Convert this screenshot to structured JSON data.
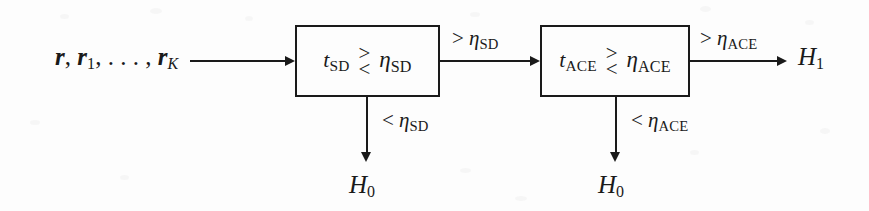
{
  "diagram": {
    "background_color": "#fdfdfd",
    "line_color": "#1a1a1a",
    "input": {
      "label_r": "r",
      "comma1": ", ",
      "label_r1": "r",
      "sub_1": "1",
      "ellipsis": ", . . . , ",
      "label_rK": "r",
      "sub_K": "K"
    },
    "stage1": {
      "statistic": "t",
      "statistic_sub": "SD",
      "cmp_top": ">",
      "cmp_bottom": "<",
      "threshold": "η",
      "threshold_sub": "SD",
      "accept_label_op": ">",
      "accept_label_sym": "η",
      "accept_label_sub": "SD",
      "reject_label_op": "<",
      "reject_label_sym": "η",
      "reject_label_sub": "SD",
      "reject_output": "H",
      "reject_output_sub": "0"
    },
    "stage2": {
      "statistic": "t",
      "statistic_sub": "ACE",
      "cmp_top": ">",
      "cmp_bottom": "<",
      "threshold": "η",
      "threshold_sub": "ACE",
      "accept_label_op": ">",
      "accept_label_sym": "η",
      "accept_label_sub": "ACE",
      "reject_label_op": "<",
      "reject_label_sym": "η",
      "reject_label_sub": "ACE",
      "reject_output": "H",
      "reject_output_sub": "0",
      "accept_output": "H",
      "accept_output_sub": "1"
    }
  }
}
